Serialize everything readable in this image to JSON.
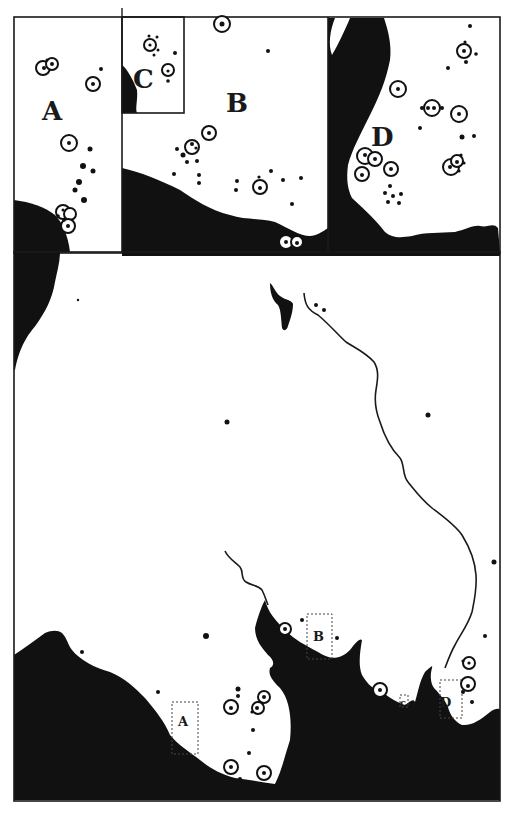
{
  "map": {
    "insets": [
      {
        "id": "A",
        "label": "A"
      },
      {
        "id": "B",
        "label": "B"
      },
      {
        "id": "C",
        "label": "C"
      },
      {
        "id": "D",
        "label": "D"
      }
    ],
    "main_map": {
      "inset_markers": [
        {
          "id": "A",
          "label": "A"
        },
        {
          "id": "B",
          "label": "B"
        },
        {
          "id": "C",
          "label": "c"
        },
        {
          "id": "D",
          "label": "D"
        }
      ]
    },
    "legend_symbols": {
      "ringed_site": "circle-with-dot",
      "small_site": "dot"
    },
    "colors": {
      "land": "#111111",
      "background": "#ffffff",
      "ink": "#1a1a1a"
    }
  }
}
